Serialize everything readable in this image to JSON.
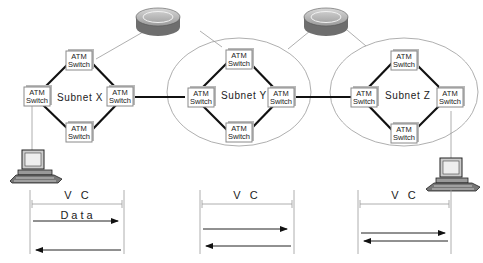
{
  "diagram": {
    "subnets": [
      {
        "label": "Subnet X"
      },
      {
        "label": "Subnet Y"
      },
      {
        "label": "Subnet Z"
      }
    ],
    "switch_label_line1": "ATM",
    "switch_label_line2": "Switch",
    "routers": 2,
    "hosts": 2,
    "segments": [
      {
        "label": "V C",
        "data_label": "Data"
      },
      {
        "label": "V C",
        "data_label": ""
      },
      {
        "label": "V C",
        "data_label": ""
      }
    ]
  }
}
